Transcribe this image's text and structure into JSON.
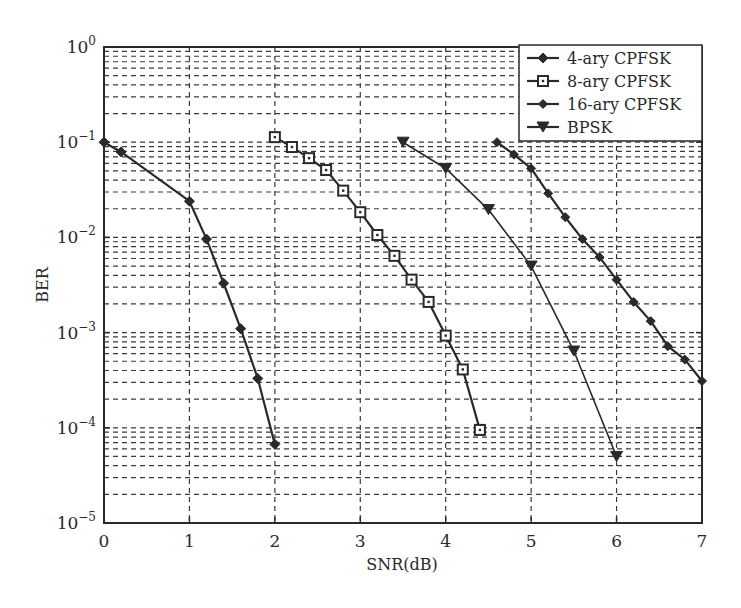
{
  "chart_data": {
    "type": "line",
    "title": "",
    "xlabel": "SNR(dB)",
    "ylabel": "BER",
    "xlim": [
      0,
      7
    ],
    "ylim": [
      1e-05,
      1
    ],
    "yscale": "log",
    "grid": true,
    "grid_style": "dashed, major and minor",
    "legend_position": "upper right",
    "x_ticks": [
      0,
      1,
      2,
      3,
      4,
      5,
      6,
      7
    ],
    "x_tick_labels": [
      "0",
      "1",
      "2",
      "3",
      "4",
      "5",
      "6",
      "7"
    ],
    "y_ticks": [
      1,
      0.1,
      0.01,
      0.001,
      0.0001,
      1e-05
    ],
    "y_tick_labels": [
      {
        "base": "10",
        "exp": "0"
      },
      {
        "base": "10",
        "exp": "−1"
      },
      {
        "base": "10",
        "exp": "−2"
      },
      {
        "base": "10",
        "exp": "−3"
      },
      {
        "base": "10",
        "exp": "−4"
      },
      {
        "base": "10",
        "exp": "−5"
      }
    ],
    "series": [
      {
        "name": "4-ary CPFSK",
        "marker": "diamond-filled",
        "line_width": 2.2,
        "x": [
          0,
          0.2,
          1.0,
          1.2,
          1.4,
          1.6,
          1.8,
          2.0
        ],
        "values": [
          0.1,
          0.079,
          0.024,
          0.0096,
          0.0033,
          0.0011,
          0.00033,
          6.7e-05
        ]
      },
      {
        "name": "8-ary CPFSK",
        "marker": "square-open",
        "line_width": 2.2,
        "x": [
          2.0,
          2.2,
          2.4,
          2.6,
          2.8,
          3.0,
          3.2,
          3.4,
          3.6,
          3.8,
          4.0,
          4.2,
          4.4
        ],
        "values": [
          0.113,
          0.089,
          0.068,
          0.051,
          0.031,
          0.0184,
          0.0106,
          0.0064,
          0.0036,
          0.0021,
          0.00093,
          0.00041,
          9.5e-05
        ]
      },
      {
        "name": "16-ary CPFSK",
        "marker": "diamond-small",
        "line_width": 2.2,
        "x": [
          4.6,
          4.8,
          5.0,
          5.2,
          5.4,
          5.6,
          5.8,
          6.0,
          6.2,
          6.4,
          6.6,
          6.8,
          7.0
        ],
        "values": [
          0.1,
          0.074,
          0.053,
          0.029,
          0.0163,
          0.0096,
          0.0062,
          0.0036,
          0.0021,
          0.00132,
          0.00072,
          0.00052,
          0.00031
        ]
      },
      {
        "name": "BPSK",
        "marker": "triangle-down",
        "line_width": 1.6,
        "x": [
          3.5,
          4.0,
          4.5,
          5.0,
          5.5,
          6.0
        ],
        "values": [
          0.1,
          0.053,
          0.0196,
          0.005,
          0.00064,
          5e-05
        ]
      }
    ]
  },
  "colors": {
    "ink": "#2a2a2a",
    "grid": "#3a3a3a",
    "background": "#ffffff"
  }
}
